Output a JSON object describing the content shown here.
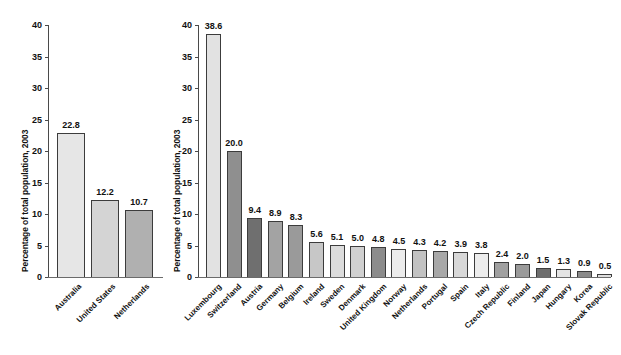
{
  "figure": {
    "background": "#ffffff",
    "width": 621,
    "height": 355
  },
  "panels": [
    {
      "id": "left",
      "ylabel": "Percentage of total population, 2003",
      "yticks": [
        "0",
        "5",
        "10",
        "15",
        "20",
        "25",
        "30",
        "35",
        "40"
      ]
    },
    {
      "id": "right",
      "ylabel": "Percentage of total population, 2003",
      "yticks": [
        "0",
        "5",
        "10",
        "15",
        "20",
        "25",
        "30",
        "35",
        "40"
      ]
    }
  ],
  "chart_data": [
    {
      "type": "bar",
      "id": "left-panel",
      "title": "",
      "xlabel": "",
      "ylabel": "Percentage of total population, 2003",
      "ylim": [
        0,
        40
      ],
      "ytick_values": [
        0,
        5,
        10,
        15,
        20,
        25,
        30,
        35,
        40
      ],
      "grid": false,
      "legend": "none",
      "value_labels": true,
      "categories": [
        "Australia",
        "United States",
        "Netherlands"
      ],
      "values": [
        22.8,
        12.2,
        10.7
      ],
      "value_label_text": [
        "22.8",
        "12.2",
        "10.7"
      ],
      "bar_colors": [
        "#e6e6e6",
        "#d4d4d4",
        "#b0b0b0"
      ]
    },
    {
      "type": "bar",
      "id": "right-panel",
      "title": "",
      "xlabel": "",
      "ylabel": "Percentage of total population, 2003",
      "ylim": [
        0,
        40
      ],
      "ytick_values": [
        0,
        5,
        10,
        15,
        20,
        25,
        30,
        35,
        40
      ],
      "grid": false,
      "legend": "none",
      "value_labels": true,
      "categories": [
        "Luxembourg",
        "Switzerland",
        "Austria",
        "Germany",
        "Belgium",
        "Ireland",
        "Sweden",
        "Denmark",
        "United Kingdom",
        "Norway",
        "Netherlands",
        "Portugal",
        "Spain",
        "Italy",
        "Czech Republic",
        "Finland",
        "Japan",
        "Hungary",
        "Korea",
        "Slovak Republic"
      ],
      "values": [
        38.6,
        20.0,
        9.4,
        8.9,
        8.3,
        5.6,
        5.1,
        5.0,
        4.8,
        4.5,
        4.3,
        4.2,
        3.9,
        3.8,
        2.4,
        2.0,
        1.5,
        1.3,
        0.9,
        0.5
      ],
      "value_label_text": [
        "38.6",
        "20.0",
        "9.4",
        "8.9",
        "8.3",
        "5.6",
        "5.1",
        "5.0",
        "4.8",
        "4.5",
        "4.3",
        "4.2",
        "3.9",
        "3.8",
        "2.4",
        "2.0",
        "1.5",
        "1.3",
        "0.9",
        "0.5"
      ],
      "bar_colors": [
        "#e2e2e2",
        "#8f8f8f",
        "#6f6f6f",
        "#a3a3a3",
        "#9a9a9a",
        "#c7c7c7",
        "#dcdcdc",
        "#d0d0d0",
        "#8c8c8c",
        "#ececec",
        "#c2c2c2",
        "#a8a8a8",
        "#d8d8d8",
        "#ededed",
        "#a0a0a0",
        "#9a9a9a",
        "#6e6e6e",
        "#e4e4e4",
        "#8a8a8a",
        "#dedede"
      ]
    }
  ]
}
